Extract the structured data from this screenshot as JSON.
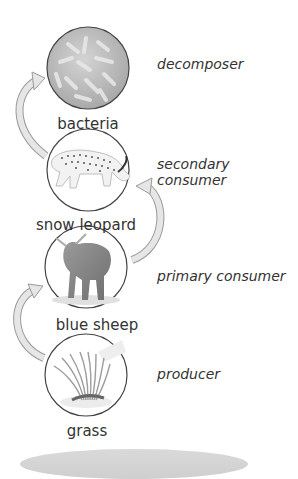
{
  "diagram": {
    "levels": [
      {
        "organism": "bacteria",
        "role": "decomposer",
        "icon": "bacteria-icon"
      },
      {
        "organism": "snow leopard",
        "role": "secondary consumer",
        "icon": "snow-leopard-icon"
      },
      {
        "organism": "blue sheep",
        "role": "primary consumer",
        "icon": "blue-sheep-icon"
      },
      {
        "organism": "grass",
        "role": "producer",
        "icon": "grass-icon"
      }
    ],
    "arrows": [
      {
        "from": "grass",
        "to": "blue sheep"
      },
      {
        "from": "blue sheep",
        "to": "snow leopard"
      },
      {
        "from": "snow leopard",
        "to": "bacteria"
      }
    ],
    "colors": {
      "arrow_fill": "#e6e6e6",
      "arrow_stroke": "#9a9a9a",
      "circle_stroke": "#444444",
      "bacteria_fill": "#bdbdbd"
    }
  }
}
